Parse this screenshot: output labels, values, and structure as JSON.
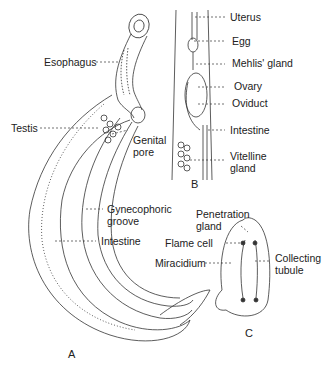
{
  "figure": {
    "panels": [
      {
        "id": "A",
        "label": "A"
      },
      {
        "id": "B",
        "label": "B"
      },
      {
        "id": "C",
        "label": "C"
      }
    ],
    "labels_a": {
      "esophagus": "Esophagus",
      "testis": "Testis",
      "genital_pore_1": "Genital",
      "genital_pore_2": "pore",
      "gynecophoric_1": "Gynecophoric",
      "gynecophoric_2": "groove",
      "intestine": "Intestine"
    },
    "labels_b": {
      "uterus": "Uterus",
      "egg": "Egg",
      "mehlis": "Mehlis' gland",
      "ovary": "Ovary",
      "oviduct": "Oviduct",
      "intestine": "Intestine",
      "vitelline_1": "Vitelline",
      "vitelline_2": "gland"
    },
    "labels_c": {
      "penetration_1": "Penetration",
      "penetration_2": "gland",
      "flame_cell": "Flame cell",
      "miracidium": "Miracidium",
      "collecting_1": "Collecting",
      "collecting_2": "tubule"
    }
  }
}
